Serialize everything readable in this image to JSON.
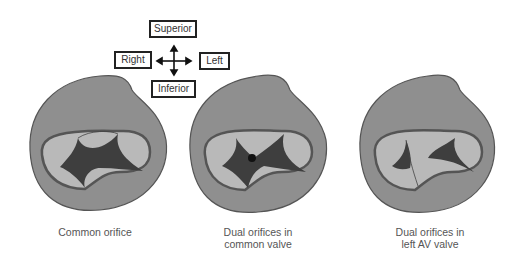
{
  "orientation": {
    "superior": "Superior",
    "inferior": "Inferior",
    "right": "Right",
    "left": "Left"
  },
  "panels": [
    {
      "caption_line1": "Common orifice",
      "caption_line2": ""
    },
    {
      "caption_line1": "Dual orifices in",
      "caption_line2": "common valve"
    },
    {
      "caption_line1": "Dual orifices in",
      "caption_line2": "left AV valve"
    }
  ],
  "colors": {
    "outer_body": "#8f8f8f",
    "outer_stroke": "#555555",
    "annulus_ring": "#7a7a7a",
    "leaflet": "#b9b9b9",
    "orifice": "#3e3e3e",
    "center_dot": "#111111"
  }
}
